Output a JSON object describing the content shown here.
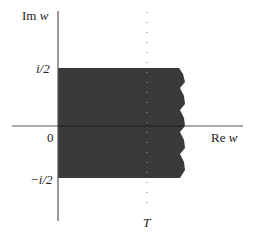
{
  "figure": {
    "type": "complex-plane-region",
    "axes": {
      "vertical_label_prefix": "Im",
      "vertical_label_var": "w",
      "horizontal_label_prefix": "Re",
      "horizontal_label_var": "w",
      "origin_label": "0"
    },
    "ticks": {
      "upper_label": "i/2",
      "lower_label": "−i/2"
    },
    "dotted_line_label": "T",
    "region": {
      "description": "Shaded strip between Im w = -1/2 and Im w = 1/2, from Re w = 0 extending right to a ragged (wavy) boundary beyond T",
      "fill_color": "#3a3a3a"
    },
    "colors": {
      "axis": "#555555",
      "fill": "#3a3a3a",
      "dots": "#777777",
      "text": "#222222"
    }
  }
}
